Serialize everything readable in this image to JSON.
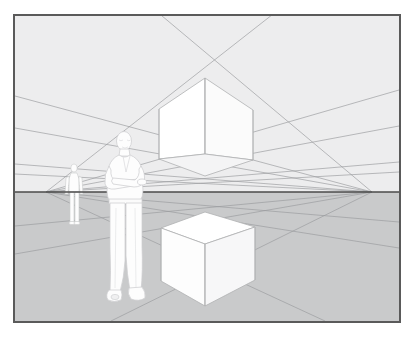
{
  "artwork": {
    "title": "Two-point perspective construction study",
    "medium": "line drawing illustration",
    "frame": {
      "border_color": "#5a5a5a",
      "border_width_px": 2,
      "x": 13,
      "y": 14,
      "width": 388,
      "height": 309
    },
    "palette": {
      "paper": "#ffffff",
      "sky_above_horizon": "#ededee",
      "ground_below_horizon": "#c9cacb",
      "horizon_line": "#4a4a4a",
      "construction_line": "#9a9b9d",
      "cube_face_light": "#ffffff",
      "cube_face_mid": "#fbfbfb",
      "cube_face_shadow": "#f2f2f2",
      "cube_edge": "#a8a9ab",
      "figure_fill": "#fdfdfd",
      "figure_outline": "#cccdcf"
    },
    "horizon": {
      "label": "horizon line / eye level",
      "y": 190,
      "x_start": 0,
      "x_end": 388
    },
    "vanishing_points": [
      {
        "name": "left-vanishing-point",
        "label": "VP left",
        "x": 31,
        "y": 176
      },
      {
        "name": "right-vanishing-point",
        "label": "VP right",
        "x": 357,
        "y": 176
      }
    ],
    "objects": [
      {
        "name": "upper-cube",
        "label": "Cube above eye level",
        "description": "White cube seen from below; underside plane visible",
        "visible_faces": [
          "left",
          "right",
          "bottom"
        ]
      },
      {
        "name": "lower-cube",
        "label": "Cube below eye level",
        "description": "White cube seen from above; top plane visible",
        "visible_faces": [
          "left",
          "right",
          "top"
        ]
      },
      {
        "name": "foreground-figure",
        "label": "Standing man with arms crossed",
        "description": "Near figure, head above horizon, feet well below"
      },
      {
        "name": "background-figure",
        "label": "Distant standing figure",
        "description": "Smaller figure further toward the left vanishing point"
      }
    ],
    "construction_lines": {
      "label": "Perspective guide lines",
      "count": 16,
      "from_left_vp": 8,
      "from_right_vp": 8
    }
  }
}
